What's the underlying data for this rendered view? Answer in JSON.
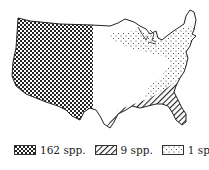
{
  "map": {
    "title": "",
    "regions": [
      {
        "id": "west",
        "pattern": "crosshatch",
        "label": "162 spp."
      },
      {
        "id": "southeast",
        "pattern": "diagonal",
        "label": "9 spp."
      },
      {
        "id": "northeast",
        "pattern": "stipple",
        "label": "1 spp."
      }
    ]
  },
  "legend": {
    "items": [
      {
        "pattern": "crosshatch",
        "label": "162 spp."
      },
      {
        "pattern": "diagonal",
        "label": "9 spp."
      },
      {
        "pattern": "stipple",
        "label": "1 spp."
      }
    ]
  },
  "colors": {
    "ink": "#222222",
    "background": "#ffffff"
  }
}
